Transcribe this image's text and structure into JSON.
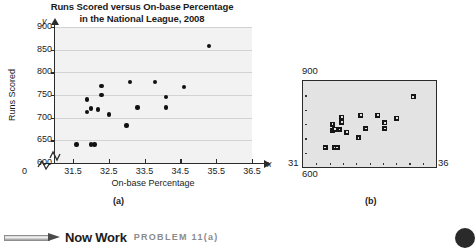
{
  "figure": {
    "panel_a": {
      "title_line1": "Runs Scored versus On-base Percentage",
      "title_line2": "in the National League, 2008",
      "caption": "(a)",
      "xlabel": "On-base Percentage",
      "ylabel": "Runs Scored",
      "x_axis_symbol": "x",
      "y_axis_symbol": "y",
      "origin_label": "0",
      "y_ticks": [
        "900",
        "850",
        "800",
        "750",
        "700",
        "650",
        "600"
      ],
      "x_ticks": [
        "31.5",
        "32.5",
        "33.5",
        "34.5",
        "35.5",
        "36.5"
      ]
    },
    "panel_b": {
      "caption": "(b)",
      "ymax_label": "900",
      "ymin_label": "600",
      "xmin_label": "31",
      "xmax_label": "36"
    }
  },
  "banner": {
    "icon": "pencil-icon",
    "label": "Now Work",
    "problem": "PROBLEM 11(a)"
  },
  "chart_data": {
    "type": "scatter",
    "title": "Runs Scored versus On-base Percentage in the National League, 2008",
    "xlabel": "On-base Percentage",
    "ylabel": "Runs Scored",
    "xlim": [
      31.0,
      36.5
    ],
    "ylim": [
      600,
      900
    ],
    "xticks": [
      31.5,
      32.5,
      33.5,
      34.5,
      35.5,
      36.5
    ],
    "yticks": [
      600,
      650,
      700,
      750,
      800,
      850,
      900
    ],
    "grid": "horizontal",
    "legend": "none",
    "axis_break": true,
    "points": [
      {
        "x": 31.6,
        "y": 641
      },
      {
        "x": 32.0,
        "y": 641
      },
      {
        "x": 32.1,
        "y": 641
      },
      {
        "x": 31.9,
        "y": 712
      },
      {
        "x": 32.0,
        "y": 720
      },
      {
        "x": 31.9,
        "y": 740
      },
      {
        "x": 32.2,
        "y": 718
      },
      {
        "x": 32.3,
        "y": 750
      },
      {
        "x": 32.3,
        "y": 770
      },
      {
        "x": 32.5,
        "y": 707
      },
      {
        "x": 33.0,
        "y": 683
      },
      {
        "x": 33.1,
        "y": 779
      },
      {
        "x": 33.3,
        "y": 722
      },
      {
        "x": 33.8,
        "y": 779
      },
      {
        "x": 34.1,
        "y": 746
      },
      {
        "x": 34.1,
        "y": 722
      },
      {
        "x": 34.6,
        "y": 767
      },
      {
        "x": 35.3,
        "y": 858
      }
    ],
    "calculator_view": {
      "xmin": 31,
      "xmax": 36,
      "ymin": 600,
      "ymax": 900,
      "marker": "square"
    }
  }
}
